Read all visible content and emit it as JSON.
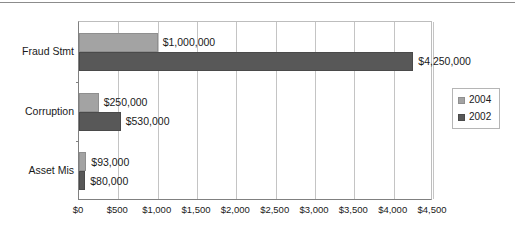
{
  "chart_data": {
    "type": "bar",
    "orientation": "horizontal",
    "title": "",
    "subtitle": "",
    "xlabel": "",
    "ylabel": "",
    "categories": [
      "Fraud Stmt",
      "Corruption",
      "Asset Mis"
    ],
    "series": [
      {
        "name": "2004",
        "color": "#a3a3a3",
        "values": [
          1000,
          250,
          93
        ],
        "value_labels": [
          "$1,000,000",
          "$250,000",
          "$93,000"
        ]
      },
      {
        "name": "2002",
        "color": "#585858",
        "values": [
          4250,
          530,
          80
        ],
        "value_labels": [
          "$4,250,000",
          "$530,000",
          "$80,000"
        ]
      }
    ],
    "xlim": [
      0,
      4500
    ],
    "xticks": [
      0,
      500,
      1000,
      1500,
      2000,
      2500,
      3000,
      3500,
      4000,
      4500
    ],
    "xtick_labels": [
      "$0",
      "$500",
      "$1,000",
      "$1,500",
      "$2,000",
      "$2,500",
      "$3,000",
      "$3,500",
      "$4,000",
      "$4,500"
    ],
    "grid": "vertical",
    "legend": {
      "position": "right",
      "entries": [
        {
          "label": "2004",
          "color": "#a3a3a3"
        },
        {
          "label": "2002",
          "color": "#585858"
        }
      ]
    },
    "units_note": "axis values in thousands of dollars"
  },
  "colors": {
    "series_2004": "#a3a3a3",
    "series_2002": "#585858",
    "gridline": "#c4c4c4",
    "axis": "#808080",
    "text": "#1a1a1a",
    "background": "#ffffff"
  }
}
